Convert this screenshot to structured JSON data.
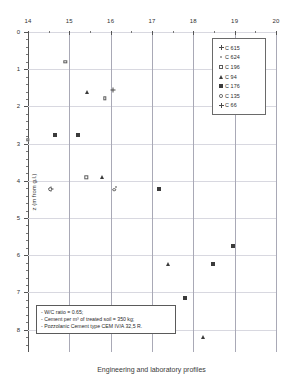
{
  "chart_data": {
    "type": "scatter",
    "title": "",
    "xlabel": "",
    "ylabel": "z (m from g.l.)",
    "xlim": [
      14,
      20
    ],
    "ylim": [
      0,
      8.6
    ],
    "y_inverted": true,
    "grid": true,
    "legend_position": "top-right",
    "xticks": [
      14,
      15,
      16,
      17,
      18,
      19,
      20
    ],
    "yticks": [
      0,
      1,
      2,
      3,
      4,
      5,
      6,
      7,
      8
    ],
    "xtick_labels": [
      "14",
      "15",
      "16",
      "17",
      "18",
      "19",
      "20"
    ],
    "ytick_labels": [
      "0",
      "1",
      "2",
      "3",
      "4",
      "5",
      "6",
      "7",
      "8"
    ],
    "series": [
      {
        "name": "C 615",
        "marker": "plus",
        "points": [
          [
            16.05,
            1.57
          ],
          [
            14.55,
            4.21
          ]
        ]
      },
      {
        "name": "C 624",
        "marker": "dot",
        "points": [
          [
            16.12,
            4.17
          ]
        ]
      },
      {
        "name": "C 196",
        "marker": "square-open",
        "points": [
          [
            14.9,
            0.8
          ],
          [
            15.86,
            1.78
          ],
          [
            14.0,
            2.9
          ],
          [
            15.41,
            3.91
          ]
        ]
      },
      {
        "name": "C 94",
        "marker": "triangle",
        "points": [
          [
            15.43,
            1.6
          ],
          [
            15.79,
            3.89
          ],
          [
            17.38,
            6.24
          ],
          [
            18.23,
            8.2
          ]
        ]
      },
      {
        "name": "C 176",
        "marker": "square-filled",
        "points": [
          [
            14.65,
            2.76
          ],
          [
            15.2,
            2.76
          ],
          [
            17.16,
            4.22
          ],
          [
            18.47,
            6.23
          ],
          [
            18.97,
            5.74
          ],
          [
            17.79,
            7.14
          ]
        ]
      },
      {
        "name": "C 135",
        "marker": "circle-open",
        "points": [
          [
            14.53,
            4.22
          ],
          [
            16.08,
            4.24
          ]
        ]
      },
      {
        "name": "C 66",
        "marker": "plus-bold",
        "points": []
      }
    ]
  },
  "axes": {
    "y_title": "z (m from g.l.)"
  },
  "legend": {
    "items": [
      {
        "label": "C 615",
        "marker": "plus"
      },
      {
        "label": "C 624",
        "marker": "dot"
      },
      {
        "label": "C 196",
        "marker": "square-open"
      },
      {
        "label": "C 94",
        "marker": "triangle"
      },
      {
        "label": "C 176",
        "marker": "square-filled"
      },
      {
        "label": "C 135",
        "marker": "circle-open"
      },
      {
        "label": "C 66",
        "marker": "plus-bold"
      }
    ]
  },
  "note_box": {
    "lines": [
      "- W/C ratio = 0.65;",
      "- Cement per m³ of treated soil = 350 kg;",
      "- Pozzolanic Cement type CEM IV/A 32,5 R."
    ]
  },
  "caption": {
    "text": "Engineering and laboratory profiles"
  }
}
